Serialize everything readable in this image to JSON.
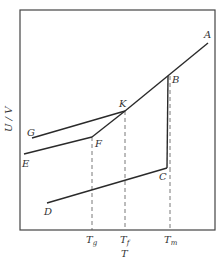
{
  "diagram": {
    "y_axis_label": "U / V",
    "x_axis_label": "T",
    "ticks": [
      {
        "main": "T",
        "sub": "g",
        "x": 92
      },
      {
        "main": "T",
        "sub": "f",
        "x": 125
      },
      {
        "main": "T",
        "sub": "m",
        "x": 169
      }
    ],
    "points": {
      "A": {
        "label": "A"
      },
      "B": {
        "label": "B"
      },
      "C": {
        "label": "C"
      },
      "D": {
        "label": "D"
      },
      "E": {
        "label": "E"
      },
      "F": {
        "label": "F"
      },
      "G": {
        "label": "G"
      },
      "K": {
        "label": "K"
      }
    }
  }
}
